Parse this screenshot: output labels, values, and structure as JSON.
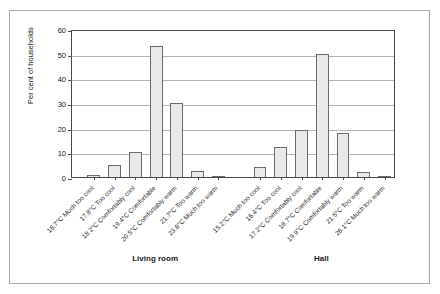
{
  "chart_data": {
    "type": "bar",
    "title": "",
    "subtitle": "",
    "xlabel": "",
    "ylabel": "Per cent of households",
    "ylim": [
      0,
      60
    ],
    "ytick_labels": [
      "0",
      "10",
      "20",
      "30",
      "40",
      "50",
      "60"
    ],
    "ytick_values": [
      0,
      10,
      20,
      30,
      40,
      50,
      60
    ],
    "grid": true,
    "legend": "none",
    "groups": [
      {
        "name": "Living room",
        "categories": [
          "16.7°C Much too cool",
          "17.8°C Too cool",
          "18.2°C Comfortably cool",
          "19.4°C Comfortable",
          "20.5°C Comfortably warm",
          "21.7°C Too warm",
          "23.6°C Much too warm"
        ],
        "values": [
          1,
          5,
          10,
          53,
          30,
          2.5,
          0.3
        ]
      },
      {
        "name": "Hall",
        "categories": [
          "15.2°C Much too cool",
          "16.4°C Too cool",
          "17.2°C Comfortably cool",
          "18.7°C Comfortable",
          "19.9°C Comfortably warm",
          "21.5°C Too warm",
          "26.1°C Much too warm"
        ],
        "values": [
          4,
          12,
          19,
          50,
          18,
          2,
          0.2
        ]
      }
    ],
    "colors": {
      "bar_fill": "#e9e9e9",
      "bar_stroke": "#6b6b6b",
      "gridline": "#b4b4b4",
      "axis": "#4a4a4a",
      "frame": "#a9a9a9",
      "text": "#1a1a1a",
      "background": "#ffffff"
    }
  }
}
